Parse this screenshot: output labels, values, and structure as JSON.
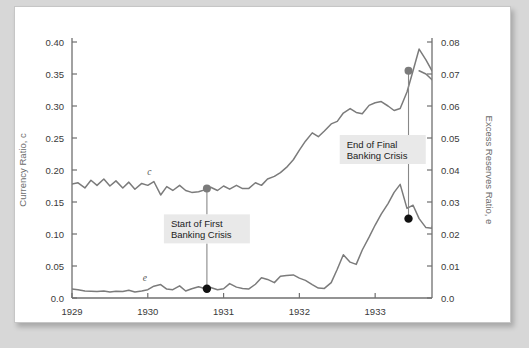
{
  "chart_data": {
    "type": "line",
    "title": "",
    "xlabel": "",
    "ylabel": "Currency Ratio, c",
    "y2label": "Excess Reserves Ratio, e",
    "xlim": [
      1929.0,
      1933.75
    ],
    "ylim": [
      0.0,
      0.4
    ],
    "y2lim": [
      0.0,
      0.08
    ],
    "grid": false,
    "legend": "inline-series-labels",
    "x_tick_labels": [
      "1929",
      "1930",
      "1931",
      "1932",
      "1933"
    ],
    "x_tick_values": [
      1929,
      1930,
      1931,
      1932,
      1933
    ],
    "y_tick_labels": [
      "0.0",
      "0.05",
      "0.10",
      "0.15",
      "0.20",
      "0.25",
      "0.30",
      "0.35",
      "0.40"
    ],
    "y_tick_values": [
      0.0,
      0.05,
      0.1,
      0.15,
      0.2,
      0.25,
      0.3,
      0.35,
      0.4
    ],
    "y2_tick_labels": [
      "0.0",
      "0.01",
      "0.02",
      "0.03",
      "0.04",
      "0.05",
      "0.06",
      "0.07",
      "0.08"
    ],
    "y2_tick_values": [
      0.0,
      0.01,
      0.02,
      0.03,
      0.04,
      0.05,
      0.06,
      0.07,
      0.08
    ],
    "series": [
      {
        "name": "c",
        "label": "c",
        "axis": "left",
        "color": "#7b7b7b",
        "label_x": 1930.02,
        "label_y": 0.192,
        "x": [
          1929.0,
          1929.08,
          1929.17,
          1929.25,
          1929.33,
          1929.42,
          1929.5,
          1929.58,
          1929.67,
          1929.75,
          1929.83,
          1929.92,
          1930.0,
          1930.08,
          1930.17,
          1930.25,
          1930.33,
          1930.42,
          1930.5,
          1930.58,
          1930.67,
          1930.75,
          1930.83,
          1930.92,
          1931.0,
          1931.08,
          1931.17,
          1931.25,
          1931.33,
          1931.42,
          1931.5,
          1931.58,
          1931.67,
          1931.75,
          1931.83,
          1931.92,
          1932.0,
          1932.08,
          1932.17,
          1932.25,
          1932.33,
          1932.42,
          1932.5,
          1932.58,
          1932.67,
          1932.75,
          1932.83,
          1932.92,
          1933.0,
          1933.08,
          1933.17,
          1933.25,
          1933.33,
          1933.42,
          1933.5,
          1933.58,
          1933.67,
          1933.75
        ],
        "values": [
          0.178,
          0.18,
          0.172,
          0.184,
          0.176,
          0.186,
          0.175,
          0.183,
          0.172,
          0.181,
          0.17,
          0.179,
          0.176,
          0.182,
          0.161,
          0.174,
          0.168,
          0.176,
          0.168,
          0.165,
          0.166,
          0.169,
          0.173,
          0.168,
          0.175,
          0.17,
          0.176,
          0.171,
          0.171,
          0.18,
          0.176,
          0.186,
          0.19,
          0.196,
          0.204,
          0.216,
          0.231,
          0.245,
          0.258,
          0.252,
          0.261,
          0.272,
          0.276,
          0.289,
          0.296,
          0.29,
          0.288,
          0.301,
          0.305,
          0.307,
          0.3,
          0.293,
          0.296,
          0.322,
          0.355,
          0.389,
          0.372,
          0.355
        ]
      },
      {
        "name": "c_tail",
        "label": "",
        "axis": "left",
        "color": "#7b7b7b",
        "x": [
          1933.58,
          1933.67,
          1933.75,
          1933.83,
          1933.92,
          1934.0
        ],
        "values": [
          0.355,
          0.35,
          0.341,
          0.333,
          0.326,
          0.318
        ]
      },
      {
        "name": "e",
        "label": "e",
        "axis": "right",
        "color": "#7b7b7b",
        "label_x": 1929.96,
        "label_y": 0.0052,
        "x": [
          1929.0,
          1929.08,
          1929.17,
          1929.25,
          1929.33,
          1929.42,
          1929.5,
          1929.58,
          1929.67,
          1929.75,
          1929.83,
          1929.92,
          1930.0,
          1930.08,
          1930.17,
          1930.25,
          1930.33,
          1930.42,
          1930.5,
          1930.58,
          1930.67,
          1930.75,
          1930.83,
          1930.92,
          1931.0,
          1931.08,
          1931.17,
          1931.25,
          1931.33,
          1931.42,
          1931.5,
          1931.58,
          1931.67,
          1931.75,
          1931.83,
          1931.92,
          1932.0,
          1932.08,
          1932.17,
          1932.25,
          1932.33,
          1932.42,
          1932.5,
          1932.58,
          1932.67,
          1932.75,
          1932.83,
          1932.92,
          1933.0,
          1933.08,
          1933.17,
          1933.25,
          1933.33,
          1933.42,
          1933.5,
          1933.58,
          1933.67,
          1933.75
        ],
        "values": [
          0.0028,
          0.0026,
          0.0022,
          0.0021,
          0.002,
          0.0022,
          0.0019,
          0.0021,
          0.002,
          0.0024,
          0.0019,
          0.0022,
          0.0026,
          0.0037,
          0.0042,
          0.0028,
          0.0026,
          0.0038,
          0.0022,
          0.0029,
          0.0035,
          0.003,
          0.0033,
          0.0026,
          0.0029,
          0.0045,
          0.0034,
          0.003,
          0.0028,
          0.0043,
          0.0063,
          0.0058,
          0.0048,
          0.0068,
          0.007,
          0.0072,
          0.0062,
          0.0055,
          0.0042,
          0.0031,
          0.003,
          0.0048,
          0.009,
          0.0135,
          0.0112,
          0.0105,
          0.015,
          0.019,
          0.0228,
          0.0262,
          0.0295,
          0.033,
          0.0355,
          0.028,
          0.029,
          0.0248,
          0.022,
          0.0218
        ]
      },
      {
        "name": "e_tail",
        "label": "",
        "axis": "right",
        "color": "#7b7b7b",
        "x": [
          1933.75,
          1933.83,
          1933.92,
          1934.0
        ],
        "values": [
          0.0218,
          0.03,
          0.042,
          0.052
        ]
      }
    ],
    "annotations": [
      {
        "id": "start-first-banking-crisis",
        "text_line1": "Start of First",
        "text_line2": "Banking Crisis",
        "x": 1930.78,
        "marker_upper_value": 0.171,
        "marker_upper_axis": "left",
        "marker_upper_color": "#7b7b7b",
        "marker_lower_value": 0.0029,
        "marker_lower_axis": "right",
        "marker_lower_color": "#111111",
        "box_cx": 1930.78,
        "box_cy_left": 0.108
      },
      {
        "id": "end-final-banking-crisis",
        "text_line1": "End of Final",
        "text_line2": "Banking Crisis",
        "x": 1933.44,
        "marker_upper_value": 0.355,
        "marker_upper_axis": "left",
        "marker_upper_color": "#7b7b7b",
        "marker_lower_value": 0.0248,
        "marker_lower_axis": "right",
        "marker_lower_color": "#111111",
        "box_cx": 1933.1,
        "box_cy_left": 0.232
      }
    ],
    "colors": {
      "line": "#7b7b7b",
      "axis": "#6f6f6f",
      "tick_text": "#3a3a3a",
      "axis_title": "#6b6b6b",
      "annotation_box": "#e9e9e9",
      "annotation_text": "#222222",
      "marker_gray": "#7b7b7b",
      "marker_black": "#111111",
      "plot_background": "#ffffff",
      "page_background": "#d7d7d7"
    }
  }
}
